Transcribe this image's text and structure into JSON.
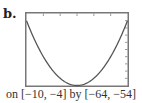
{
  "figure": {
    "label": "b.",
    "caption": "on [−10, −4] by [−64, −54]"
  },
  "colors": {
    "frame": "#777777",
    "curve": "#555555",
    "ticks": "#999999"
  },
  "chart_data": {
    "type": "line",
    "title": "",
    "xlabel": "",
    "ylabel": "",
    "xlim": [
      -10,
      -4
    ],
    "ylim": [
      -64,
      -54
    ],
    "x_tick_step": 1,
    "y_tick_step": 1,
    "grid": false,
    "legend": null,
    "series": [
      {
        "name": "parabola",
        "x": [
          -10,
          -9.5,
          -9,
          -8.5,
          -8,
          -7.5,
          -7,
          -6.5,
          -6,
          -5.5,
          -5,
          -4.5,
          -4
        ],
        "values": [
          -55,
          -57.75,
          -60,
          -61.75,
          -63,
          -63.75,
          -64,
          -63.75,
          -63,
          -61.75,
          -60,
          -57.75,
          -55
        ]
      }
    ],
    "annotations": [
      "on [−10, −4] by [−64, −54]"
    ]
  }
}
